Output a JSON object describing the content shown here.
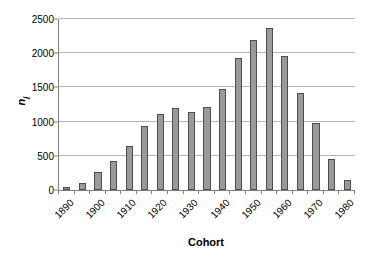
{
  "chart_data": {
    "type": "bar",
    "title": "",
    "xlabel": "Cohort",
    "ylabel": "n_j",
    "ylabel_base": "n",
    "ylabel_sub": "j",
    "ylim": [
      0,
      2500
    ],
    "yticks": [
      0,
      500,
      1000,
      1500,
      2000,
      2500
    ],
    "ytick_labels": [
      "0",
      "500",
      "1000",
      "1500",
      "2000",
      "2500"
    ],
    "grid": true,
    "legend": "none",
    "categories": [
      "1890",
      "1895",
      "1900",
      "1905",
      "1910",
      "1915",
      "1920",
      "1925",
      "1930",
      "1935",
      "1940",
      "1945",
      "1950",
      "1955",
      "1960",
      "1965",
      "1970",
      "1975",
      "1980"
    ],
    "xtick_labels": [
      "1890",
      "1900",
      "1910",
      "1920",
      "1930",
      "1940",
      "1950",
      "1960",
      "1970",
      "1980"
    ],
    "xtick_label_every": 2,
    "values": [
      40,
      100,
      265,
      425,
      640,
      930,
      1115,
      1200,
      1140,
      1220,
      1475,
      1930,
      2190,
      2370,
      1960,
      1420,
      975,
      450,
      145
    ],
    "bar_color": "#9a9a9a",
    "bar_edge_color": "#4d4d4d",
    "grid_color": "#b5b5b5",
    "axis_color": "#808080",
    "background": "#ffffff"
  }
}
